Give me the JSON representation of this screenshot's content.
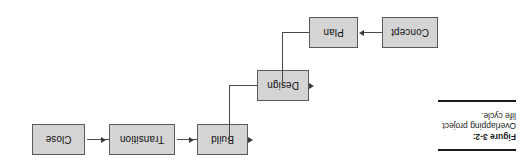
{
  "figure": {
    "label": "Figure 3-2:",
    "caption": " Overlapping project life cycle.",
    "rule_color": "#1a1a1a"
  },
  "diagram": {
    "type": "flowchart",
    "orientation": "rotated-180",
    "node_fill": "#d4d4d4",
    "node_border": "#5a5a5a",
    "connector_color": "#4a4a4a",
    "nodes": [
      {
        "id": "concept",
        "label": "Concept"
      },
      {
        "id": "plan",
        "label": "Plan"
      },
      {
        "id": "design",
        "label": "Design"
      },
      {
        "id": "build",
        "label": "Build"
      },
      {
        "id": "transition",
        "label": "Transition"
      },
      {
        "id": "close",
        "label": "Close"
      }
    ],
    "edges": [
      {
        "from": "Concept",
        "to": "Plan"
      },
      {
        "from": "Plan",
        "to": "Design"
      },
      {
        "from": "Design",
        "to": "Build"
      },
      {
        "from": "Build",
        "to": "Transition"
      },
      {
        "from": "Transition",
        "to": "Close"
      }
    ]
  }
}
